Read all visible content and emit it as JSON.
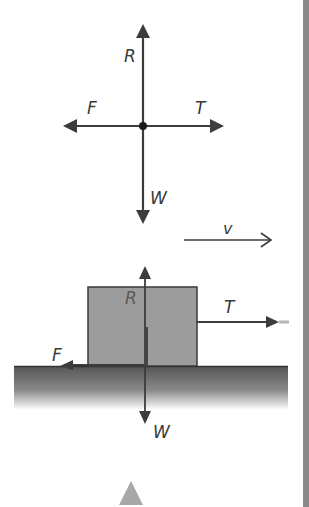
{
  "diagram": {
    "free_body": {
      "labels": {
        "up": "R",
        "left": "F",
        "right": "T",
        "down": "W"
      }
    },
    "velocity": {
      "label": "v"
    },
    "block_scene": {
      "labels": {
        "up": "R",
        "left": "F",
        "right": "T",
        "down": "W"
      }
    },
    "nav": {
      "up_marker": "▲"
    },
    "colors": {
      "arrow": "#3c3c3c",
      "block_fill": "#9a9a9a",
      "ground_top": "#5a5a5a",
      "ground_bottom": "#ffffff",
      "side_bar": "#8a8a8a",
      "triangle": "#a8a8a8"
    }
  }
}
